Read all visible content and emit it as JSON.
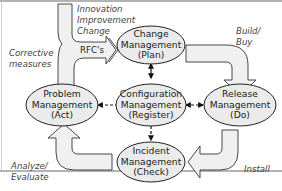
{
  "diagram": {
    "colors": {
      "node_fill": "#ebebeb",
      "node_stroke": "#222222",
      "arrow_fill": "#f0f0f0",
      "arrow_stroke": "#333333",
      "frame": "#9a9a9a",
      "text": "#222222",
      "label_text": "#444444"
    },
    "nodes": {
      "change": {
        "line1": "Change",
        "line2": "Management",
        "line3": "(Plan)"
      },
      "configuration": {
        "line1": "Configuration",
        "line2": "Management",
        "line3": "(Register)"
      },
      "release": {
        "line1": "Release",
        "line2": "Management",
        "line3": "(Do)"
      },
      "incident": {
        "line1": "Incident",
        "line2": "Management",
        "line3": "(Check)"
      },
      "problem": {
        "line1": "Problem",
        "line2": "Management",
        "line3": "(Act)"
      }
    },
    "labels": {
      "innovation": "Innovation",
      "improvement": "Improvement",
      "change": "Change",
      "rfcs": "RFC's",
      "corrective": "Corrective",
      "measures": "measures",
      "build": "Build/",
      "buy": "Buy",
      "install": "Install",
      "analyze": "Analyze/",
      "evaluate": "Evaluate"
    },
    "edges": [
      {
        "from": "change",
        "to": "configuration",
        "style": "solid",
        "direction": "both"
      },
      {
        "from": "configuration",
        "to": "problem",
        "style": "dashed",
        "direction": "to-problem"
      },
      {
        "from": "configuration",
        "to": "release",
        "style": "dashed",
        "direction": "both"
      },
      {
        "from": "configuration",
        "to": "incident",
        "style": "dashed",
        "direction": "to-incident"
      }
    ],
    "flow_arrows": [
      {
        "from": "problem",
        "to": "change",
        "label": "RFC's"
      },
      {
        "from": "change",
        "to": "release",
        "label": "Build/ Buy"
      },
      {
        "from": "release",
        "to": "incident",
        "label": "Install"
      },
      {
        "from": "incident",
        "to": "problem",
        "label": "Analyze/ Evaluate"
      }
    ]
  }
}
